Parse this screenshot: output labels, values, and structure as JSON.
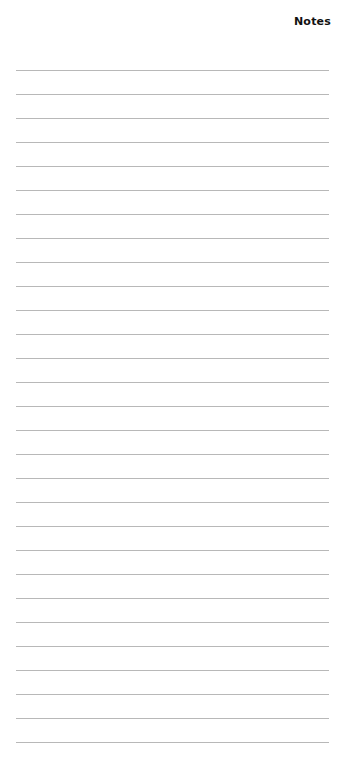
{
  "page": {
    "title": "Notes",
    "line_count": 29,
    "line_color": "#b8b8b8"
  }
}
